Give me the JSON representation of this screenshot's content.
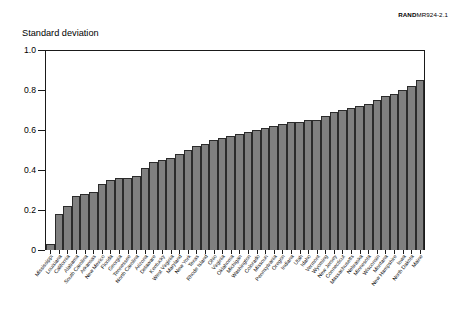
{
  "figure": {
    "credit_brand": "RAND",
    "credit_code": "MR924-2.1",
    "y_axis_title": "Standard deviation"
  },
  "axes": {
    "y_ticks": [
      "0",
      "0.2",
      "0.4",
      "0.6",
      "0.8",
      "1.0"
    ]
  },
  "chart_data": {
    "type": "bar",
    "title": "",
    "subtitle": "",
    "xlabel": "",
    "ylabel": "Standard deviation",
    "ylim": [
      0,
      1.0
    ],
    "xlim": null,
    "grid": false,
    "legend": null,
    "legend_position": "none",
    "annotations": [
      "RANDMR924-2.1"
    ],
    "y_tick_values": [
      0,
      0.2,
      0.4,
      0.6,
      0.8,
      1.0
    ],
    "bar_color": "#808080",
    "bar_edge_color": "#2b2b2b",
    "sort_order": "ascending",
    "categories": [
      "Mississippi",
      "Louisiana",
      "California",
      "Alabama",
      "South Carolina",
      "Arkansas",
      "New Mexico",
      "Florida",
      "Georgia",
      "Tennessee",
      "North Carolina",
      "Arizona",
      "Delaware",
      "Kentucky",
      "West Virginia",
      "Maryland",
      "New York",
      "Texas",
      "Rhode Island",
      "Ohio",
      "Virginia",
      "Oklahoma",
      "Michigan",
      "Washington",
      "Colorado",
      "Missouri",
      "Pennsylvania",
      "Oregon",
      "Indiana",
      "Utah",
      "Idaho",
      "Vermont",
      "Wyoming",
      "New Jersey",
      "Connecticut",
      "Massachusetts",
      "Nebraska",
      "Minnesota",
      "Wisconsin",
      "Montana",
      "New Hampshire",
      "Iowa",
      "North Dakota",
      "Maine"
    ],
    "values": [
      0.03,
      0.18,
      0.22,
      0.27,
      0.28,
      0.29,
      0.33,
      0.35,
      0.36,
      0.36,
      0.37,
      0.41,
      0.44,
      0.45,
      0.46,
      0.48,
      0.5,
      0.52,
      0.53,
      0.55,
      0.56,
      0.57,
      0.58,
      0.59,
      0.6,
      0.61,
      0.62,
      0.63,
      0.64,
      0.64,
      0.65,
      0.65,
      0.67,
      0.69,
      0.7,
      0.71,
      0.72,
      0.73,
      0.75,
      0.77,
      0.78,
      0.8,
      0.82,
      0.85
    ]
  }
}
